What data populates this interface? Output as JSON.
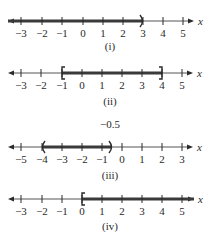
{
  "colors": {
    "ink": "#2a2a2a",
    "axis": "#555555",
    "highlight": "#3a3a3a",
    "background": "#ffffff"
  },
  "number_lines": [
    {
      "id": "i",
      "caption": "(i)",
      "axis_y": 21,
      "caption_y": 50,
      "left_arrow_x": 8,
      "right_arrow_x": 194,
      "axis_variable": "x",
      "ticks": [
        {
          "value": -3,
          "label": "−3",
          "x": 21
        },
        {
          "value": -2,
          "label": "−2",
          "x": 42
        },
        {
          "value": -1,
          "label": "−1",
          "x": 62
        },
        {
          "value": 0,
          "label": "0",
          "x": 83
        },
        {
          "value": 1,
          "label": "1",
          "x": 103
        },
        {
          "value": 2,
          "label": "2",
          "x": 123
        },
        {
          "value": 3,
          "label": "3",
          "x": 143
        },
        {
          "value": 4,
          "label": "4",
          "x": 163
        },
        {
          "value": 5,
          "label": "5",
          "x": 183
        }
      ],
      "interval": {
        "from_x": 8,
        "to_x": 143,
        "from": "-infinity",
        "to": 3,
        "left_end": "arrow",
        "right_end": ")",
        "notation": "(-∞, 3)"
      }
    },
    {
      "id": "ii",
      "caption": "(ii)",
      "axis_y": 73,
      "caption_y": 105,
      "left_arrow_x": 8,
      "right_arrow_x": 193,
      "axis_variable": "x",
      "ticks": [
        {
          "value": -3,
          "label": "−3",
          "x": 21
        },
        {
          "value": -2,
          "label": "−2",
          "x": 41
        },
        {
          "value": -1,
          "label": "−1",
          "x": 62
        },
        {
          "value": 0,
          "label": "0",
          "x": 82
        },
        {
          "value": 1,
          "label": "1",
          "x": 102
        },
        {
          "value": 2,
          "label": "2",
          "x": 122
        },
        {
          "value": 3,
          "label": "3",
          "x": 142
        },
        {
          "value": 4,
          "label": "4",
          "x": 162
        },
        {
          "value": 5,
          "label": "5",
          "x": 182
        }
      ],
      "interval": {
        "from_x": 62,
        "to_x": 162,
        "from": -1,
        "to": 4,
        "left_end": "[",
        "right_end": "]",
        "notation": "[-1, 4]"
      }
    },
    {
      "id": "iii",
      "caption": "(iii)",
      "axis_y": 147,
      "caption_y": 179,
      "left_arrow_x": 8,
      "right_arrow_x": 193,
      "axis_variable": "x",
      "note": {
        "text": "−0.5",
        "x": 110,
        "y": 128
      },
      "ticks": [
        {
          "value": -5,
          "label": "−5",
          "x": 21
        },
        {
          "value": -4,
          "label": "−4",
          "x": 42
        },
        {
          "value": -3,
          "label": "−3",
          "x": 62
        },
        {
          "value": -2,
          "label": "−2",
          "x": 82
        },
        {
          "value": -1,
          "label": "−1",
          "x": 102
        },
        {
          "value": 0,
          "label": "0",
          "x": 122
        },
        {
          "value": 1,
          "label": "1",
          "x": 142
        },
        {
          "value": 2,
          "label": "2",
          "x": 162
        },
        {
          "value": 3,
          "label": "3",
          "x": 182
        }
      ],
      "interval": {
        "from_x": 42,
        "to_x": 112,
        "from": -4,
        "to": -0.5,
        "left_end": "(",
        "right_end": ")",
        "notation": "(-4, -0.5)"
      }
    },
    {
      "id": "iv",
      "caption": "(iv)",
      "axis_y": 199,
      "caption_y": 230,
      "left_arrow_x": 8,
      "right_arrow_x": 194,
      "axis_variable": "x",
      "ticks": [
        {
          "value": -3,
          "label": "−3",
          "x": 21
        },
        {
          "value": -2,
          "label": "−2",
          "x": 42
        },
        {
          "value": -1,
          "label": "−1",
          "x": 62
        },
        {
          "value": 0,
          "label": "0",
          "x": 82
        },
        {
          "value": 1,
          "label": "1",
          "x": 102
        },
        {
          "value": 2,
          "label": "2",
          "x": 122
        },
        {
          "value": 3,
          "label": "3",
          "x": 142
        },
        {
          "value": 4,
          "label": "4",
          "x": 162
        },
        {
          "value": 5,
          "label": "5",
          "x": 182
        }
      ],
      "interval": {
        "from_x": 82,
        "to_x": 194,
        "from": 0,
        "to": "infinity",
        "left_end": "[",
        "right_end": "arrow",
        "notation": "[0, ∞)"
      }
    }
  ]
}
